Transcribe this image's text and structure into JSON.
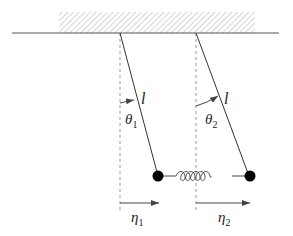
{
  "diagram": {
    "labels": {
      "length_left": "l",
      "length_right": "l",
      "theta1": "θ",
      "theta1_sub": "1",
      "theta2": "θ",
      "theta2_sub": "2",
      "eta1": "η",
      "eta1_sub": "1",
      "eta2": "η",
      "eta2_sub": "2"
    },
    "colors": {
      "line": "#333333",
      "hatch": "#b0b0b0",
      "dashed": "#999999",
      "bob": "#000000"
    }
  }
}
